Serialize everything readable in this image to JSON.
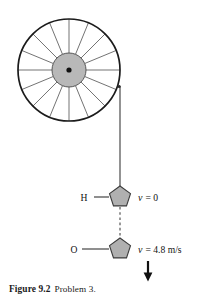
{
  "figure": {
    "caption_label": "Figure 9.2",
    "caption_text": "Problem 3.",
    "wheel": {
      "name": "pulley-wheel",
      "spoke_count": 16,
      "rim_color": "#1b1b1b",
      "hub_color": "#b8b8b8",
      "spoke_color": "#5a5a5a",
      "center_x": 69,
      "center_y": 70,
      "rim_radius": 51,
      "hub_radius": 17
    },
    "cord": {
      "name": "cord",
      "color": "#3a3a3a",
      "top_x": 120,
      "top_y": 87,
      "bottom_y": 190
    },
    "masses": [
      {
        "atom_label": "H",
        "velocity_v": "v",
        "velocity_rest": "= 0",
        "center_x": 120,
        "center_y": 197,
        "fill_color": "#b0b0b0"
      },
      {
        "atom_label": "O",
        "velocity_v": "v",
        "velocity_rest": "= 4.8 m/s",
        "center_x": 120,
        "center_y": 249,
        "fill_color": "#b0b0b0"
      }
    ],
    "arrow": {
      "name": "velocity-arrow",
      "direction": "down",
      "color": "#111111"
    }
  }
}
